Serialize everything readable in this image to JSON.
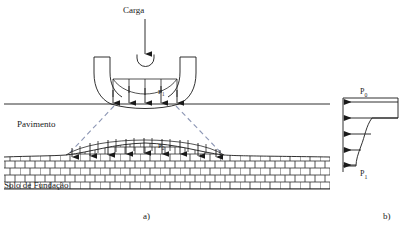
{
  "figure": {
    "caption_a": "a)",
    "caption_b": "b)",
    "language": "pt-BR",
    "colors": {
      "line": "#1a1a1a",
      "dashed_spread": "#8c96b4",
      "hatch": "#2b2b2b",
      "background": "#ffffff"
    }
  },
  "panel_a": {
    "load_label": "Carga",
    "pavement_label": "Pavimento",
    "subgrade_label": "Solo de Fundação",
    "tire_contact_pressure_label": "P",
    "tire_contact_pressure_sub": "1",
    "subgrade_pressure_label": "P",
    "subgrade_pressure_sub": "2",
    "tire_contact_arrow_count": 5,
    "subgrade_arrow_count": 9,
    "load_arrow": "down-arrow",
    "spread_lines": "dashed-load-spread"
  },
  "panel_b": {
    "top_pressure_label": "P",
    "top_pressure_sub": "0",
    "bottom_pressure_label": "P",
    "bottom_pressure_sub": "1",
    "arrow_count": 5,
    "profile": "stepped-decreasing-pressure-curve"
  }
}
